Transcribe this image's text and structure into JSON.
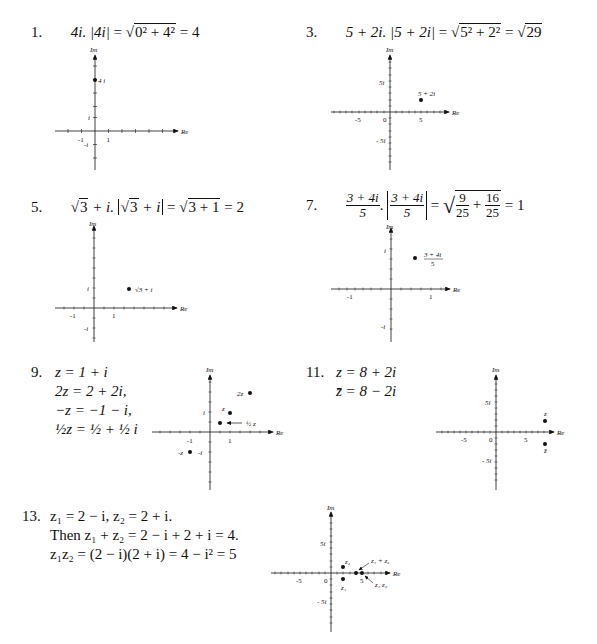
{
  "problems": [
    {
      "number": "1.",
      "text": "4i. |4i| = √(0² + 4²) = 4",
      "parts": {
        "z": "4i.",
        "lhs": "|4i|",
        "eq1": "=",
        "rad": "0² + 4²",
        "eq2": "= 4"
      },
      "graph": {
        "axis_x_label": "Re",
        "axis_y_label": "Im",
        "ticks": {
          "x_neg": "-1",
          "x_pos": "1",
          "y_pos": "i",
          "y_neg": "-i"
        },
        "points": [
          {
            "label": "4 i",
            "re": 0,
            "im": 4
          }
        ]
      }
    },
    {
      "number": "3.",
      "text": "5 + 2i. |5 + 2i| = √(5² + 2²) = √29",
      "parts": {
        "z": "5 + 2i.",
        "lhs": "|5 + 2i|",
        "eq1": "=",
        "rad": "5² + 2²",
        "eq2": "=",
        "rad2": "29"
      },
      "graph": {
        "axis_x_label": "Re",
        "axis_y_label": "Im",
        "ticks": {
          "x_neg": "-5",
          "x_zero": "0",
          "x_pos": "5",
          "y_pos": "5i",
          "y_neg": "- 5i"
        },
        "points": [
          {
            "label": "5 + 2i",
            "re": 5,
            "im": 2
          }
        ]
      }
    },
    {
      "number": "5.",
      "text": "√3 + i. |√3 + i| = √(3 + 1) = 2",
      "parts": {
        "z_rad": "3",
        "z_rest": " + i.",
        "lhs_rad": "3",
        "lhs_rest": " + i",
        "eq1": "=",
        "rad": "3 + 1",
        "eq2": "= 2"
      },
      "graph": {
        "axis_x_label": "Re",
        "axis_y_label": "Im",
        "ticks": {
          "x_neg": "-1",
          "x_pos": "1",
          "y_pos": "i",
          "y_neg": "-i"
        },
        "points": [
          {
            "label": "√3 + i",
            "re": 1.732,
            "im": 1
          }
        ]
      }
    },
    {
      "number": "7.",
      "text": "(3 + 4i)/5. |(3 + 4i)/5| = √(9/25 + 16/25) = 1",
      "parts": {
        "num": "3 + 4i",
        "den": "5",
        "dot": ".",
        "eq1": "=",
        "f1n": "9",
        "f1d": "25",
        "plus": "+",
        "f2n": "16",
        "f2d": "25",
        "eq2": "= 1"
      },
      "graph": {
        "axis_x_label": "Re",
        "axis_y_label": "Im",
        "ticks": {
          "x_neg": "-1",
          "x_pos": "1",
          "y_pos": "i",
          "y_neg": "-i"
        },
        "points": [
          {
            "label_num": "3 + 4i",
            "label_den": "5",
            "re": 0.6,
            "im": 0.8
          }
        ]
      }
    },
    {
      "number": "9.",
      "lines": [
        "z = 1 + i",
        "2z = 2 + 2i,",
        "−z = −1 − i,",
        "½z = ½ + ½ i"
      ],
      "graph": {
        "axis_x_label": "Re",
        "axis_y_label": "Im",
        "ticks": {
          "x_neg": "-1",
          "x_pos": "1",
          "y_pos": "i",
          "y_neg": "-i"
        },
        "points": [
          {
            "label": "2z",
            "re": 2,
            "im": 2
          },
          {
            "label": "z",
            "re": 1,
            "im": 1
          },
          {
            "label": "½ z",
            "re": 0.5,
            "im": 0.5,
            "arrow": true
          },
          {
            "label": "-z",
            "re": -1,
            "im": -1
          }
        ]
      }
    },
    {
      "number": "11.",
      "lines": [
        "z = 8 + 2i",
        "z̄ = 8 − 2i"
      ],
      "graph": {
        "axis_x_label": "Re",
        "axis_y_label": "Im",
        "ticks": {
          "x_neg": "-5",
          "x_zero": "0",
          "x_pos": "5",
          "y_pos": "5i",
          "y_neg": "- 5i"
        },
        "points": [
          {
            "label": "z",
            "re": 8,
            "im": 2
          },
          {
            "label": "z̄",
            "re": 8,
            "im": -2
          }
        ]
      }
    },
    {
      "number": "13.",
      "lines": [
        "z₁ = 2 − i, z₂ = 2 + i.",
        "Then z₁ + z₂ = 2 − i + 2 + i = 4.",
        "z₁z₂ = (2 − i)(2 + i) = 4 − i² = 5"
      ],
      "graph": {
        "axis_x_label": "Re",
        "axis_y_label": "Im",
        "ticks": {
          "x_neg": "-5",
          "x_zero": "0",
          "x_pos": "5",
          "y_pos": "5i",
          "y_neg": "- 5i"
        },
        "points": [
          {
            "label": "z₂",
            "re": 2,
            "im": 1
          },
          {
            "label": "z₁",
            "re": 2,
            "im": -1
          },
          {
            "label": "z₁ + z₂",
            "re": 4,
            "im": 0,
            "arrow": true
          },
          {
            "label": "z₁ z₂",
            "re": 5,
            "im": 0,
            "arrow": true
          }
        ]
      }
    }
  ]
}
